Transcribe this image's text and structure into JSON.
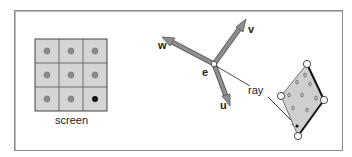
{
  "diagram": {
    "screen": {
      "label": "screen",
      "rows": 3,
      "cols": 3,
      "pixel_fill": "#d4d4d4",
      "sample_color": "#8c8c8c",
      "highlighted_sample_color": "#111111",
      "highlighted_cell": [
        2,
        2
      ]
    },
    "camera": {
      "eye_label": "e",
      "axes": [
        {
          "name": "u",
          "label": "u"
        },
        {
          "name": "v",
          "label": "v"
        },
        {
          "name": "w",
          "label": "w"
        }
      ],
      "arrow_color": "#8f8f8f"
    },
    "ray": {
      "label": "ray"
    },
    "triangle_mesh": {
      "fill": "#cfcfcf",
      "vertex_count": 4
    }
  }
}
